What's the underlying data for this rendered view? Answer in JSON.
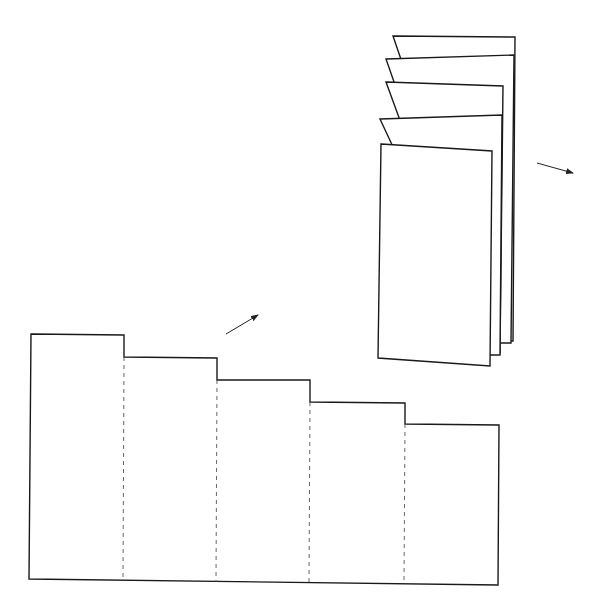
{
  "diagram": {
    "title": "",
    "colors": {
      "line": "#1a1a1a",
      "fold_line": "#555555",
      "background": "#ffffff"
    },
    "flat_strip": {
      "panel_count": 5,
      "outline_points": "31,334 124,335 124,357 217,358 217,380 310,380 310,402 405,403 405,424 499,425 498,585 29,579",
      "fold_lines": [
        {
          "x1": 124,
          "y1": 357,
          "x2": 123,
          "y2": 581
        },
        {
          "x1": 217,
          "y1": 380,
          "x2": 216,
          "y2": 582
        },
        {
          "x1": 310,
          "y1": 402,
          "x2": 309,
          "y2": 583
        },
        {
          "x1": 405,
          "y1": 424,
          "x2": 404,
          "y2": 584
        }
      ]
    },
    "folded_booklet": {
      "panels": [
        {
          "points": "393,36 515,37 513,341 497,341"
        },
        {
          "points": "386,59 514,55 511,343 485,343"
        },
        {
          "points": "386,82 503,86 500,353 485,353"
        },
        {
          "points": "380,119 502,115 500,355 490,355"
        },
        {
          "points": "381,144 492,151 490,366 378,358"
        }
      ]
    },
    "arrows": [
      {
        "name": "fold-direction-arrow",
        "x1": 226,
        "y1": 334,
        "x2": 258,
        "y2": 315
      },
      {
        "name": "output-direction-arrow",
        "x1": 537,
        "y1": 163,
        "x2": 573,
        "y2": 173
      }
    ]
  }
}
